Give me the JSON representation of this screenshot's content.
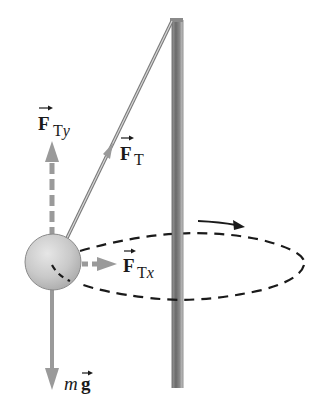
{
  "diagram": {
    "type": "conical-pendulum-free-body",
    "colors": {
      "background": "#ffffff",
      "pole_dark": "#6e6e6e",
      "pole_light": "#bdbdbd",
      "string": "#7a7a7a",
      "ball_fill": "#c8c8c8",
      "ball_stroke": "#8a8a8a",
      "force_arrow": "#9a9a9a",
      "path_dash": "#1a1a1a",
      "text": "#1a1a1a"
    },
    "labels": {
      "tension_y": {
        "main": "F",
        "sub": "Ty"
      },
      "tension": {
        "main": "F",
        "sub": "T"
      },
      "tension_x": {
        "main": "F",
        "sub": "Tx"
      },
      "weight": {
        "prefix": "m",
        "main": "g"
      }
    },
    "elements": {
      "pole": "vertical pole",
      "string": "string from pole top to ball",
      "ball": "ball mass",
      "circular_path": "dashed horizontal circular path",
      "rotation_arrow": "direction of motion arrow"
    }
  }
}
